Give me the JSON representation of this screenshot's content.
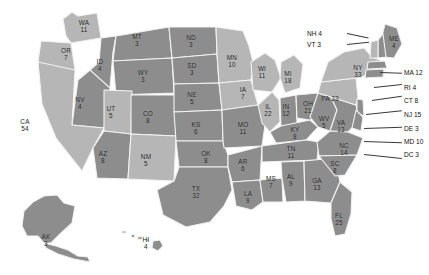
{
  "map": {
    "title": "United States Electoral College Map",
    "colors": {
      "dark_state": "#8d8d8d",
      "light_state": "#b6b6b6",
      "border": "#f2f2f2",
      "background": "#ffffff",
      "label_text": "#1c1c1c",
      "leader_line": "#3a3a3a"
    },
    "inline_states": [
      {
        "abbr": "WA",
        "votes": "11",
        "x": 84,
        "y": 26,
        "shade": "light"
      },
      {
        "abbr": "OR",
        "votes": "7",
        "x": 66,
        "y": 54,
        "shade": "light"
      },
      {
        "abbr": "CA",
        "votes": "54",
        "x": 25,
        "y": 125,
        "shade": "light"
      },
      {
        "abbr": "NV",
        "votes": "4",
        "x": 80,
        "y": 103,
        "shade": "dark"
      },
      {
        "abbr": "ID",
        "votes": "4",
        "x": 100,
        "y": 65,
        "shade": "dark"
      },
      {
        "abbr": "MT",
        "votes": "3",
        "x": 137,
        "y": 40,
        "shade": "dark"
      },
      {
        "abbr": "WY",
        "votes": "3",
        "x": 143,
        "y": 76,
        "shade": "dark"
      },
      {
        "abbr": "UT",
        "votes": "5",
        "x": 111,
        "y": 112,
        "shade": "light"
      },
      {
        "abbr": "CO",
        "votes": "8",
        "x": 148,
        "y": 117,
        "shade": "dark"
      },
      {
        "abbr": "AZ",
        "votes": "8",
        "x": 103,
        "y": 157,
        "shade": "dark"
      },
      {
        "abbr": "NM",
        "votes": "5",
        "x": 146,
        "y": 160,
        "shade": "light"
      },
      {
        "abbr": "ND",
        "votes": "3",
        "x": 191,
        "y": 41,
        "shade": "dark"
      },
      {
        "abbr": "SD",
        "votes": "3",
        "x": 192,
        "y": 69,
        "shade": "dark"
      },
      {
        "abbr": "NE",
        "votes": "5",
        "x": 192,
        "y": 98,
        "shade": "dark"
      },
      {
        "abbr": "KS",
        "votes": "6",
        "x": 196,
        "y": 128,
        "shade": "dark"
      },
      {
        "abbr": "OK",
        "votes": "8",
        "x": 206,
        "y": 157,
        "shade": "dark"
      },
      {
        "abbr": "TX",
        "votes": "32",
        "x": 196,
        "y": 192,
        "shade": "dark"
      },
      {
        "abbr": "MN",
        "votes": "10",
        "x": 232,
        "y": 61,
        "shade": "light"
      },
      {
        "abbr": "IA",
        "votes": "7",
        "x": 243,
        "y": 93,
        "shade": "light"
      },
      {
        "abbr": "MO",
        "votes": "11",
        "x": 243,
        "y": 128,
        "shade": "dark"
      },
      {
        "abbr": "AR",
        "votes": "6",
        "x": 243,
        "y": 165,
        "shade": "dark"
      },
      {
        "abbr": "LA",
        "votes": "9",
        "x": 248,
        "y": 197,
        "shade": "dark"
      },
      {
        "abbr": "WI",
        "votes": "11",
        "x": 262,
        "y": 72,
        "shade": "light"
      },
      {
        "abbr": "IL",
        "votes": "22",
        "x": 268,
        "y": 110,
        "shade": "light"
      },
      {
        "abbr": "MS",
        "votes": "7",
        "x": 271,
        "y": 182,
        "shade": "dark"
      },
      {
        "abbr": "MI",
        "votes": "18",
        "x": 288,
        "y": 77,
        "shade": "light"
      },
      {
        "abbr": "IN",
        "votes": "12",
        "x": 286,
        "y": 110,
        "shade": "dark"
      },
      {
        "abbr": "KY",
        "votes": "8",
        "x": 295,
        "y": 133,
        "shade": "dark"
      },
      {
        "abbr": "TN",
        "votes": "11",
        "x": 291,
        "y": 152,
        "shade": "dark"
      },
      {
        "abbr": "AL",
        "votes": "9",
        "x": 291,
        "y": 180,
        "shade": "dark"
      },
      {
        "abbr": "OH",
        "votes": "21",
        "x": 308,
        "y": 107,
        "shade": "dark"
      },
      {
        "abbr": "WV",
        "votes": "5",
        "x": 324,
        "y": 122,
        "shade": "dark"
      },
      {
        "abbr": "GA",
        "votes": "13",
        "x": 317,
        "y": 184,
        "shade": "dark"
      },
      {
        "abbr": "VA",
        "votes": "13",
        "x": 341,
        "y": 126,
        "shade": "dark"
      },
      {
        "abbr": "NC",
        "votes": "14",
        "x": 344,
        "y": 149,
        "shade": "dark"
      },
      {
        "abbr": "SC",
        "votes": "8",
        "x": 335,
        "y": 167,
        "shade": "dark"
      },
      {
        "abbr": "FL",
        "votes": "25",
        "x": 339,
        "y": 219,
        "shade": "dark"
      },
      {
        "abbr": "PA",
        "votes": "23",
        "x": 330,
        "y": 98,
        "shade": "light",
        "inline": true
      },
      {
        "abbr": "NY",
        "votes": "33",
        "x": 358,
        "y": 71,
        "shade": "light"
      },
      {
        "abbr": "ME",
        "votes": "4",
        "x": 394,
        "y": 42,
        "shade": "dark"
      },
      {
        "abbr": "AK",
        "votes": "3",
        "x": 46,
        "y": 240,
        "shade": "dark"
      },
      {
        "abbr": "HI",
        "votes": "4",
        "x": 146,
        "y": 243,
        "shade": "dark"
      }
    ],
    "callouts_left": [
      {
        "label": "NH 4",
        "x": 329,
        "y": 33,
        "lx": 347,
        "ly": 33,
        "lw": 22,
        "lrot": 12
      },
      {
        "label": "VT 3",
        "x": 329,
        "y": 44,
        "lx": 347,
        "ly": 44,
        "lw": 22,
        "lrot": -6
      }
    ],
    "callouts_right": [
      {
        "label": "MA 12",
        "x": 404,
        "y": 72,
        "lx": 380,
        "ly": 72,
        "lw": 22,
        "lrot": 2
      },
      {
        "label": "RI 4",
        "x": 404,
        "y": 87,
        "lx": 374,
        "ly": 87,
        "lw": 28,
        "lrot": -6
      },
      {
        "label": "CT 8",
        "x": 404,
        "y": 100,
        "lx": 372,
        "ly": 100,
        "lw": 30,
        "lrot": -8
      },
      {
        "label": "NJ 15",
        "x": 404,
        "y": 114,
        "lx": 366,
        "ly": 114,
        "lw": 36,
        "lrot": -6
      },
      {
        "label": "DE 3",
        "x": 404,
        "y": 128,
        "lx": 364,
        "ly": 128,
        "lw": 38,
        "lrot": -2
      },
      {
        "label": "MD 10",
        "x": 404,
        "y": 141,
        "lx": 364,
        "ly": 141,
        "lw": 38,
        "lrot": 2
      },
      {
        "label": "DC 3",
        "x": 404,
        "y": 154,
        "lx": 364,
        "ly": 154,
        "lw": 38,
        "lrot": 6
      }
    ]
  }
}
